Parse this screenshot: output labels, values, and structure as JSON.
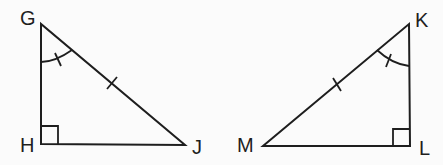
{
  "diagram": {
    "colors": {
      "stroke": "#1e1e1e",
      "background": "#fbfbfb"
    },
    "triangles": [
      {
        "name": "GHJ",
        "vertices": {
          "G": {
            "label": "G",
            "x": 41,
            "y": 24
          },
          "H": {
            "label": "H",
            "x": 41,
            "y": 144
          },
          "J": {
            "label": "J",
            "x": 185,
            "y": 145
          }
        },
        "right_angle_at": "H",
        "marked_angle": "G",
        "marked_side": "GJ"
      },
      {
        "name": "KLM",
        "vertices": {
          "K": {
            "label": "K",
            "x": 409,
            "y": 24
          },
          "L": {
            "label": "L",
            "x": 410,
            "y": 146
          },
          "M": {
            "label": "M",
            "x": 263,
            "y": 146
          }
        },
        "right_angle_at": "L",
        "marked_angle": "K",
        "marked_side": "MK"
      }
    ],
    "labels": {
      "G": "G",
      "H": "H",
      "J": "J",
      "K": "K",
      "L": "L",
      "M": "M"
    }
  }
}
